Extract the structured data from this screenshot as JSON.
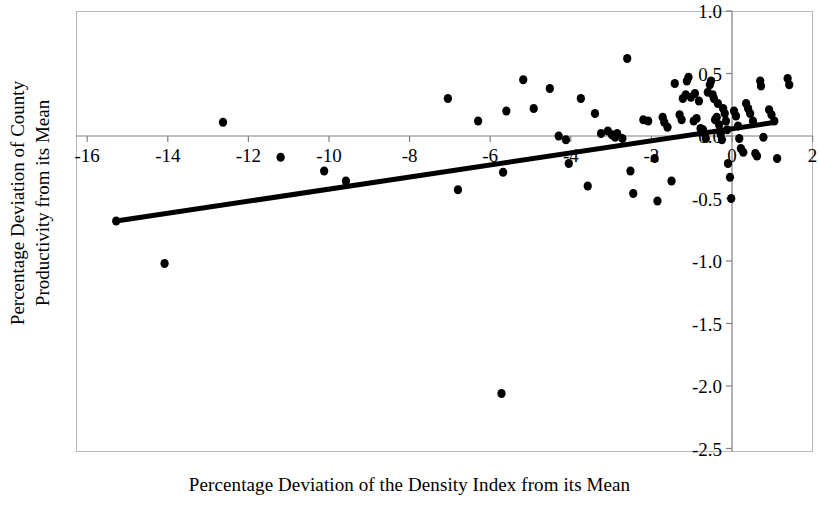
{
  "chart_data": {
    "type": "scatter",
    "title": "",
    "xlabel": "Percentage Deviation of the Density Index from its Mean",
    "ylabel": "Percentage Deviation of County Productivity from its Mean",
    "ylabel_lines": [
      "Percentage Deviation of County",
      "Productivity from its Mean"
    ],
    "xlim": [
      -16.8,
      2.15
    ],
    "ylim": [
      -2.5,
      1.0
    ],
    "xticks": [
      -16,
      -14,
      -12,
      -10,
      -8,
      -6,
      -4,
      -2,
      0,
      2
    ],
    "xtick_labels": [
      "-16",
      "-14",
      "-12",
      "-10",
      "-8",
      "-6",
      "-4",
      "-2",
      "0",
      "2"
    ],
    "yticks": [
      1.0,
      0.5,
      0.0,
      -0.5,
      -1.0,
      -1.5,
      -2.0,
      -2.5
    ],
    "ytick_labels": [
      "1.0",
      "0.5",
      "0.0",
      "-0.5",
      "-1.0",
      "-1.5",
      "-2.0",
      "-2.5"
    ],
    "grid": false,
    "legend": null,
    "axis_style": {
      "frame_color": "#b9b9b9",
      "axis_line_color": "#808080",
      "zero_line_y": 0.0,
      "zero_line_x": 0.0
    },
    "marker": {
      "shape": "circle",
      "color": "#000000",
      "size_px": 9
    },
    "trendline": {
      "type": "linear-fit",
      "color": "#000000",
      "width_px": 5,
      "x_start": -15.28,
      "y_start": -0.68,
      "x_end": 1.07,
      "y_end": 0.11,
      "slope": 0.0483,
      "intercept": 0.059
    },
    "points": [
      [
        -15.28,
        -0.68
      ],
      [
        -14.08,
        -1.02
      ],
      [
        -12.63,
        0.11
      ],
      [
        -11.2,
        -0.17
      ],
      [
        -10.12,
        -0.28
      ],
      [
        -9.58,
        -0.36
      ],
      [
        -7.05,
        0.3
      ],
      [
        -6.8,
        -0.43
      ],
      [
        -6.3,
        0.12
      ],
      [
        -5.72,
        -2.06
      ],
      [
        -5.68,
        -0.29
      ],
      [
        -5.6,
        0.2
      ],
      [
        -5.18,
        0.45
      ],
      [
        -4.92,
        0.22
      ],
      [
        -4.52,
        0.38
      ],
      [
        -4.3,
        0.0
      ],
      [
        -4.12,
        -0.03
      ],
      [
        -4.05,
        -0.22
      ],
      [
        -3.75,
        0.3
      ],
      [
        -3.58,
        -0.4
      ],
      [
        -3.4,
        0.18
      ],
      [
        -3.25,
        0.02
      ],
      [
        -3.08,
        0.04
      ],
      [
        -2.98,
        0.01
      ],
      [
        -2.9,
        -0.01
      ],
      [
        -2.85,
        0.02
      ],
      [
        -2.72,
        -0.02
      ],
      [
        -2.6,
        0.62
      ],
      [
        -2.52,
        -0.28
      ],
      [
        -2.45,
        -0.46
      ],
      [
        -2.2,
        0.13
      ],
      [
        -2.08,
        0.12
      ],
      [
        -1.92,
        -0.18
      ],
      [
        -1.85,
        -0.52
      ],
      [
        -1.72,
        0.15
      ],
      [
        -1.68,
        0.11
      ],
      [
        -1.6,
        0.07
      ],
      [
        -1.5,
        -0.36
      ],
      [
        -1.42,
        0.42
      ],
      [
        -1.3,
        0.17
      ],
      [
        -1.25,
        0.13
      ],
      [
        -1.22,
        0.3
      ],
      [
        -1.15,
        0.33
      ],
      [
        -1.12,
        0.44
      ],
      [
        -1.08,
        0.47
      ],
      [
        -1.02,
        0.31
      ],
      [
        -0.95,
        0.12
      ],
      [
        -0.92,
        0.34
      ],
      [
        -0.88,
        0.14
      ],
      [
        -0.82,
        0.28
      ],
      [
        -0.78,
        0.06
      ],
      [
        -0.72,
        0.05
      ],
      [
        -0.68,
        0.02
      ],
      [
        -0.65,
        -0.02
      ],
      [
        -0.6,
        0.35
      ],
      [
        -0.55,
        0.41
      ],
      [
        -0.52,
        0.44
      ],
      [
        -0.48,
        0.33
      ],
      [
        -0.45,
        0.3
      ],
      [
        -0.42,
        0.13
      ],
      [
        -0.38,
        0.15
      ],
      [
        -0.35,
        0.26
      ],
      [
        -0.32,
        0.09
      ],
      [
        -0.3,
        0.04
      ],
      [
        -0.28,
        0.01
      ],
      [
        -0.25,
        -0.03
      ],
      [
        -0.22,
        0.22
      ],
      [
        -0.18,
        0.18
      ],
      [
        -0.15,
        0.12
      ],
      [
        -0.12,
        0.05
      ],
      [
        -0.1,
        -0.22
      ],
      [
        -0.05,
        -0.33
      ],
      [
        -0.02,
        -0.5
      ],
      [
        0.05,
        0.2
      ],
      [
        0.1,
        0.16
      ],
      [
        0.15,
        0.08
      ],
      [
        0.18,
        -0.02
      ],
      [
        0.22,
        -0.1
      ],
      [
        0.28,
        -0.13
      ],
      [
        0.35,
        0.26
      ],
      [
        0.4,
        0.22
      ],
      [
        0.45,
        0.18
      ],
      [
        0.52,
        0.12
      ],
      [
        0.58,
        -0.14
      ],
      [
        0.62,
        -0.16
      ],
      [
        0.7,
        0.44
      ],
      [
        0.72,
        0.4
      ],
      [
        0.78,
        -0.01
      ],
      [
        0.92,
        0.21
      ],
      [
        0.98,
        0.17
      ],
      [
        1.05,
        0.12
      ],
      [
        1.12,
        -0.18
      ],
      [
        1.38,
        0.46
      ],
      [
        1.42,
        0.41
      ]
    ]
  }
}
